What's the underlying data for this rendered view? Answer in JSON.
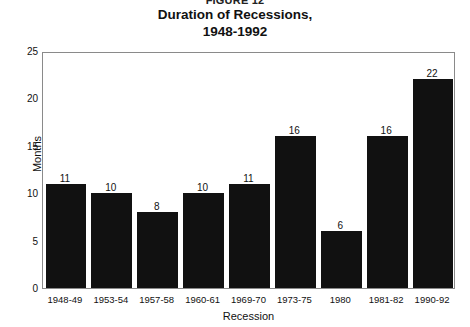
{
  "figure_number": "FIGURE 12",
  "title": {
    "line1": "Duration of Recessions,",
    "line2": "1948-1992"
  },
  "axes": {
    "ylabel": "Months",
    "xlabel": "Recession"
  },
  "chart_data": {
    "type": "bar",
    "title": "Duration of Recessions, 1948-1992",
    "xlabel": "Recession",
    "ylabel": "Months",
    "categories": [
      "1948-49",
      "1953-54",
      "1957-58",
      "1960-61",
      "1969-70",
      "1973-75",
      "1980",
      "1981-82",
      "1990-92"
    ],
    "values": [
      11,
      10,
      8,
      10,
      11,
      16,
      6,
      16,
      22
    ],
    "value_labels": [
      "11",
      "10",
      "8",
      "10",
      "11",
      "16",
      "6",
      "16",
      "22"
    ],
    "ylim": [
      0,
      25
    ],
    "yticks": [
      0,
      5,
      10,
      15,
      20,
      25
    ],
    "ytick_labels": [
      "0",
      "5",
      "10",
      "15",
      "20",
      "25"
    ],
    "grid": false,
    "legend": false,
    "bar_color": "#111111",
    "background_color": "#ffffff",
    "frame_color": "#8a8a8a"
  }
}
